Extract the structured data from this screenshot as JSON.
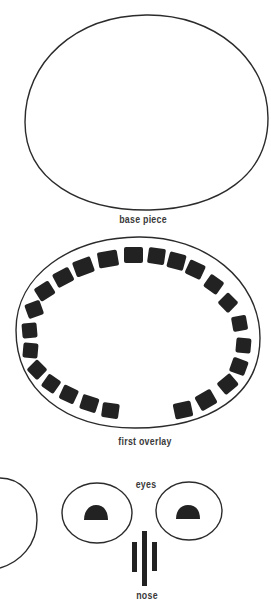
{
  "labels": {
    "base_piece": "base piece",
    "first_overlay": "first overlay",
    "eyes": "eyes",
    "nose": "nose"
  },
  "colors": {
    "stroke": "#2b2b2b",
    "fill": "#222222",
    "background": "#ffffff",
    "text": "#3a3a3a"
  },
  "figures": {
    "base_piece": {
      "shape": "ellipse-outline",
      "cx": 146,
      "cy": 112,
      "rx": 121,
      "ry": 97
    },
    "first_overlay": {
      "shape": "ellipse-outline-with-tile-ring",
      "cx": 138,
      "cy": 333,
      "rx": 122,
      "ry": 96,
      "tile_count": 30,
      "gap": "bottom-center"
    },
    "eyes": [
      {
        "cx": 97,
        "cy": 513,
        "rx": 35,
        "ry": 31,
        "pupil": "half-dome"
      },
      {
        "cx": 189,
        "cy": 511,
        "rx": 33,
        "ry": 30,
        "pupil": "half-dome"
      }
    ],
    "nose": {
      "bars": 3
    },
    "partial_circle_left": {
      "shape": "arc",
      "visible": "right edge only"
    }
  }
}
